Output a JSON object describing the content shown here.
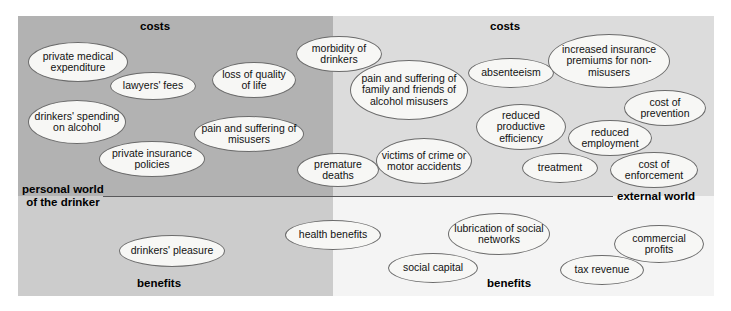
{
  "diagram": {
    "title_axes": {
      "top_left_label": "costs",
      "top_right_label": "costs",
      "bottom_left_label": "benefits",
      "bottom_right_label": "benefits",
      "left_axis_label_line1": "personal world",
      "left_axis_label_line2": "of the drinker",
      "right_axis_label": "external world"
    },
    "colors": {
      "personal_costs_bg": "#b2b2b2",
      "external_costs_bg": "#dcdcdc",
      "personal_benefits_bg": "#cccccc",
      "external_benefits_bg": "#f4f4f4",
      "node_fill": "#f7f7f5",
      "node_stroke": "#6b6b6b",
      "axis_line": "#59595b",
      "text": "#121212"
    },
    "quadrants": {
      "personal_costs": {
        "name": "personal world of the drinker — costs",
        "nodes": [
          {
            "label": "private medical expenditure"
          },
          {
            "label": "lawyers' fees"
          },
          {
            "label": "drinkers' spending on alcohol"
          },
          {
            "label": "private insurance policies"
          },
          {
            "label": "loss of quality of life"
          },
          {
            "label": "pain and suffering of misusers"
          },
          {
            "label": "morbidity of drinkers"
          },
          {
            "label": "premature deaths"
          }
        ]
      },
      "external_costs": {
        "name": "external world — costs",
        "nodes": [
          {
            "label": "pain and suffering of family and friends of alcohol misusers"
          },
          {
            "label": "absenteeism"
          },
          {
            "label": "increased insurance premiums for non-misusers"
          },
          {
            "label": "reduced productive efficiency"
          },
          {
            "label": "cost of prevention"
          },
          {
            "label": "reduced employment"
          },
          {
            "label": "victims of crime or motor accidents"
          },
          {
            "label": "treatment"
          },
          {
            "label": "cost of enforcement"
          }
        ]
      },
      "personal_benefits": {
        "name": "personal world of the drinker — benefits",
        "nodes": [
          {
            "label": "drinkers' pleasure"
          }
        ]
      },
      "external_benefits": {
        "name": "external world — benefits",
        "nodes": [
          {
            "label": "health benefits"
          },
          {
            "label": "lubrication of social networks"
          },
          {
            "label": "social capital"
          },
          {
            "label": "commercial profits"
          },
          {
            "label": "tax revenue"
          }
        ]
      }
    }
  }
}
